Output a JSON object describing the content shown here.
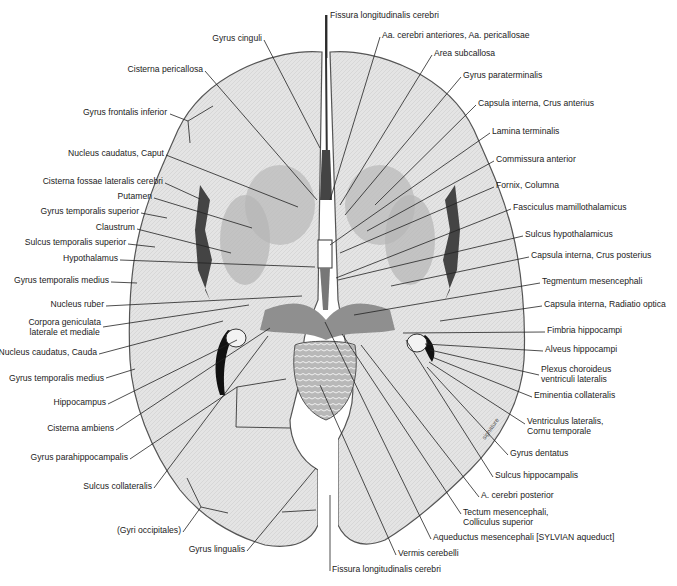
{
  "figure": {
    "signature": "signature",
    "labels_left": [
      {
        "id": "gyrus-cinguli",
        "text": "Gyrus cinguli",
        "x": 262,
        "y": 37,
        "align": "right"
      },
      {
        "id": "cisterna-pericallosa",
        "text": "Cisterna pericallosa",
        "x": 203,
        "y": 68,
        "align": "right"
      },
      {
        "id": "gyrus-frontalis-inferior",
        "text": "Gyrus frontalis inferior",
        "x": 167,
        "y": 111,
        "align": "right"
      },
      {
        "id": "nucleus-caudatus-caput",
        "text": "Nucleus caudatus, Caput",
        "x": 164,
        "y": 152,
        "align": "right"
      },
      {
        "id": "cisterna-fossae-lateralis",
        "text": "Cisterna fossae lateralis cerebri",
        "x": 163,
        "y": 180,
        "align": "right"
      },
      {
        "id": "putamen",
        "text": "Putamen",
        "x": 152,
        "y": 195,
        "align": "right"
      },
      {
        "id": "gyrus-temporalis-superior",
        "text": "Gyrus temporalis superior",
        "x": 139,
        "y": 210,
        "align": "right"
      },
      {
        "id": "claustrum",
        "text": "Claustrum",
        "x": 135,
        "y": 226,
        "align": "right"
      },
      {
        "id": "sulcus-temporalis-superior",
        "text": "Sulcus temporalis superior",
        "x": 126,
        "y": 241,
        "align": "right"
      },
      {
        "id": "hypothalamus",
        "text": "Hypothalamus",
        "x": 118,
        "y": 257,
        "align": "right"
      },
      {
        "id": "gyrus-temporalis-medius-1",
        "text": "Gyrus temporalis medius",
        "x": 109,
        "y": 279,
        "align": "right"
      },
      {
        "id": "nucleus-ruber",
        "text": "Nucleus ruber",
        "x": 104,
        "y": 303,
        "align": "right"
      },
      {
        "id": "corpora-geniculata",
        "text": "Corpora geniculata\nlaterale et mediale",
        "x": 101,
        "y": 325,
        "align": "right"
      },
      {
        "id": "nucleus-caudatus-cauda",
        "text": "Nucleus caudatus, Cauda",
        "x": 97,
        "y": 351,
        "align": "right"
      },
      {
        "id": "gyrus-temporalis-medius-2",
        "text": "Gyrus temporalis medius",
        "x": 104,
        "y": 377,
        "align": "right"
      },
      {
        "id": "hippocampus",
        "text": "Hippocampus",
        "x": 106,
        "y": 401,
        "align": "right"
      },
      {
        "id": "cisterna-ambiens",
        "text": "Cisterna ambiens",
        "x": 114,
        "y": 427,
        "align": "right"
      },
      {
        "id": "gyrus-parahippocampalis",
        "text": "Gyrus parahippocampalis",
        "x": 128,
        "y": 456,
        "align": "right"
      },
      {
        "id": "sulcus-collateralis",
        "text": "Sulcus collateralis",
        "x": 152,
        "y": 485,
        "align": "right"
      },
      {
        "id": "gyri-occipitales",
        "text": "(Gyri occipitales)",
        "x": 181,
        "y": 529,
        "align": "right"
      },
      {
        "id": "gyrus-lingualis",
        "text": "Gyrus lingualis",
        "x": 245,
        "y": 548,
        "align": "right"
      }
    ],
    "labels_right": [
      {
        "id": "fissura-longitudinalis-top",
        "text": "Fissura longitudinalis cerebri",
        "x": 330,
        "y": 14
      },
      {
        "id": "aa-cerebri-anteriores",
        "text": "Aa. cerebri anteriores, Aa. pericallosae",
        "x": 382,
        "y": 34
      },
      {
        "id": "area-subcallosa",
        "text": "Area subcallosa",
        "x": 434,
        "y": 52
      },
      {
        "id": "gyrus-paraterminalis",
        "text": "Gyrus paraterminalis",
        "x": 463,
        "y": 74
      },
      {
        "id": "capsula-interna-crus-anterius",
        "text": "Capsula interna, Crus anterius",
        "x": 478,
        "y": 102
      },
      {
        "id": "lamina-terminalis",
        "text": "Lamina terminalis",
        "x": 492,
        "y": 130
      },
      {
        "id": "commissura-anterior",
        "text": "Commissura anterior",
        "x": 496,
        "y": 158
      },
      {
        "id": "fornix-columna",
        "text": "Fornix, Columna",
        "x": 496,
        "y": 184
      },
      {
        "id": "fasciculus-mamillothalamicus",
        "text": "Fasciculus mamillothalamicus",
        "x": 513,
        "y": 206
      },
      {
        "id": "sulcus-hypothalamicus",
        "text": "Sulcus hypothalamicus",
        "x": 525,
        "y": 233
      },
      {
        "id": "capsula-interna-crus-posterius",
        "text": "Capsula interna, Crus posterius",
        "x": 531,
        "y": 254
      },
      {
        "id": "tegmentum-mesencephali",
        "text": "Tegmentum mesencephali",
        "x": 542,
        "y": 280
      },
      {
        "id": "capsula-interna-radiatio-optica",
        "text": "Capsula interna, Radiatio optica",
        "x": 544,
        "y": 303
      },
      {
        "id": "fimbria-hippocampi",
        "text": "Fimbria hippocampi",
        "x": 547,
        "y": 329
      },
      {
        "id": "alveus-hippocampi",
        "text": "Alveus hippocampi",
        "x": 545,
        "y": 348
      },
      {
        "id": "plexus-choroideus",
        "text": "Plexus choroideus\nventriculi lateralis",
        "x": 541,
        "y": 368
      },
      {
        "id": "eminentia-collateralis",
        "text": "Eminentia collateralis",
        "x": 534,
        "y": 394
      },
      {
        "id": "ventriculus-lateralis",
        "text": "Ventriculus lateralis,\nCornu temporale",
        "x": 527,
        "y": 420
      },
      {
        "id": "gyrus-dentatus",
        "text": "Gyrus dentatus",
        "x": 510,
        "y": 452
      },
      {
        "id": "sulcus-hippocampalis",
        "text": "Sulcus hippocampalis",
        "x": 495,
        "y": 474
      },
      {
        "id": "a-cerebri-posterior",
        "text": "A. cerebri posterior",
        "x": 481,
        "y": 494
      },
      {
        "id": "tectum-mesencephali",
        "text": "Tectum mesencephali,\nColliculus superior",
        "x": 463,
        "y": 511
      },
      {
        "id": "aqueductus-mesencephali",
        "text": "Aqueductus mesencephali [SYLVIAN aqueduct]",
        "x": 433,
        "y": 536
      },
      {
        "id": "vermis-cerebelli",
        "text": "Vermis cerebelli",
        "x": 398,
        "y": 552
      },
      {
        "id": "fissura-longitudinalis-bottom",
        "text": "Fissura longitudinalis cerebri",
        "x": 332,
        "y": 568
      }
    ],
    "colors": {
      "background": "#ffffff",
      "tissue_light": "#e6e6e6",
      "tissue_mid": "#c9c9c9",
      "grey_matter": "#aaaaaa",
      "dark_sulcus": "#333333",
      "leader_line": "#222222",
      "label_text": "#222222"
    }
  }
}
